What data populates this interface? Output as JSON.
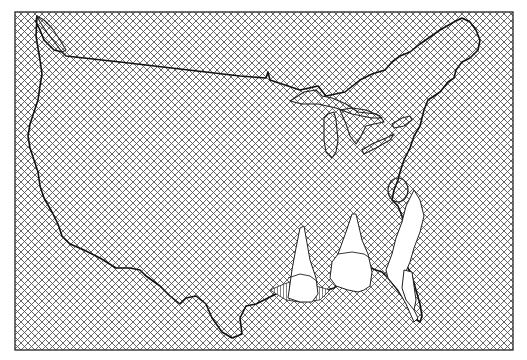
{
  "figure": {
    "type": "3d-surface-map",
    "region": "Continental United States",
    "background_pattern": "crosshatch",
    "colors": {
      "background": "#ffffff",
      "hatch": "#555555",
      "outline": "#111111",
      "frame": "#333333"
    },
    "features": [
      {
        "name": "us-outline",
        "label": ""
      },
      {
        "name": "great-lakes",
        "label": ""
      },
      {
        "name": "lake-okeechobee-or-inland-feature",
        "label": ""
      }
    ],
    "peaks": [
      {
        "name": "peak-louisiana",
        "relative_height": "tall"
      },
      {
        "name": "peak-alabama-mississippi",
        "relative_height": "tallest"
      },
      {
        "name": "ridge-florida-atlantic",
        "relative_height": "moderate"
      }
    ]
  }
}
